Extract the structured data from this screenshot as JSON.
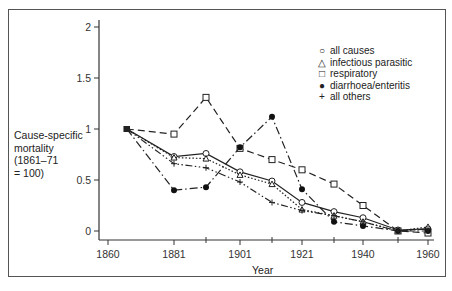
{
  "chart_data": {
    "type": "line",
    "title": "",
    "xlabel": "Year",
    "ylabel": "Cause-specific mortality (1861–71 = 100)",
    "ylabel_lines": [
      "Cause-specific",
      "mortality",
      "(1861–71",
      "= 100)"
    ],
    "x": [
      1866,
      1881,
      1891,
      1901,
      1911,
      1921,
      1931,
      1940,
      1951,
      1960
    ],
    "x_ticks": [
      1860,
      1881,
      1901,
      1921,
      1940,
      1960
    ],
    "x_minor_ticks": [
      1891,
      1911,
      1931,
      1951
    ],
    "y_ticks": [
      "0",
      "0.5",
      "1",
      "1.5",
      "2"
    ],
    "ylim": [
      0,
      2
    ],
    "grid": false,
    "legend_position": "upper right",
    "series": [
      {
        "name": "all causes",
        "marker": "open-circle",
        "line": "solid",
        "values": [
          1.0,
          0.73,
          0.76,
          0.58,
          0.49,
          0.28,
          0.19,
          0.13,
          0.01,
          0.02
        ]
      },
      {
        "name": "infectious parasitic",
        "marker": "open-triangle",
        "line": "dotted",
        "values": [
          1.0,
          0.72,
          0.71,
          0.55,
          0.46,
          0.21,
          0.15,
          0.09,
          0.0,
          0.04
        ]
      },
      {
        "name": "respiratory",
        "marker": "open-square",
        "line": "dashed",
        "values": [
          1.0,
          0.95,
          1.31,
          0.81,
          0.7,
          0.6,
          0.46,
          0.25,
          0.0,
          -0.02
        ]
      },
      {
        "name": "diarrhoea/enteritis",
        "marker": "filled-circle",
        "line": "dash-dot",
        "values": [
          1.0,
          0.4,
          0.43,
          0.82,
          1.12,
          0.41,
          0.09,
          0.05,
          0.0,
          0.0
        ]
      },
      {
        "name": "all others",
        "marker": "plus",
        "line": "dash-dot-dot",
        "values": [
          1.0,
          0.66,
          0.62,
          0.48,
          0.28,
          0.2,
          0.15,
          0.09,
          0.0,
          0.02
        ]
      }
    ]
  },
  "legend": {
    "items": [
      {
        "label": "all causes",
        "symbol": "○"
      },
      {
        "label": "infectious parasitic",
        "symbol": "△"
      },
      {
        "label": "respiratory",
        "symbol": "□"
      },
      {
        "label": "diarrhoea/enteritis",
        "symbol": "●"
      },
      {
        "label": "all others",
        "symbol": "+"
      }
    ]
  },
  "axis": {
    "x_title": "Year",
    "ylabel_lines": [
      "Cause-specific",
      "mortality",
      "(1861–71",
      "= 100)"
    ]
  }
}
